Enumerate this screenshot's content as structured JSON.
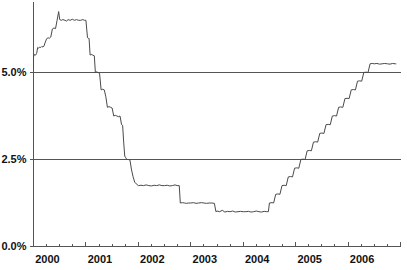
{
  "chart_data": {
    "type": "line",
    "title": "",
    "subtitle": "",
    "xlabel": "",
    "ylabel": "",
    "xlim": [
      2000.0,
      2006.92
    ],
    "ylim": [
      0.0,
      7.0
    ],
    "grid": true,
    "gridlines_y": [
      2.5,
      5.0
    ],
    "legend": null,
    "legend_position": "none",
    "y_tick_labels": [
      "0.0%",
      "2.5%",
      "5.0%"
    ],
    "y_tick_values": [
      0.0,
      2.5,
      5.0
    ],
    "x_tick_labels": [
      "2000",
      "2001",
      "2002",
      "2003",
      "2004",
      "2005",
      "2006"
    ],
    "x_tick_values": [
      2000,
      2001,
      2002,
      2003,
      2004,
      2005,
      2006
    ],
    "x_minor_ticks_per_year": 4,
    "line_color": "#4a4a4a",
    "axis_color": "#555555",
    "background_color": "#ffffff",
    "series": [
      {
        "name": "Rate",
        "x": [
          2000.0,
          2000.02,
          2000.04,
          2000.06,
          2000.08,
          2000.1,
          2000.12,
          2000.14,
          2000.16,
          2000.18,
          2000.2,
          2000.22,
          2000.25,
          2000.28,
          2000.3,
          2000.33,
          2000.36,
          2000.39,
          2000.42,
          2000.45,
          2000.48,
          2000.5,
          2000.53,
          2000.56,
          2000.6,
          2000.63,
          2000.66,
          2000.7,
          2000.74,
          2000.78,
          2000.82,
          2000.86,
          2000.9,
          2000.94,
          2000.97,
          2001.0,
          2001.03,
          2001.05,
          2001.06,
          2001.08,
          2001.1,
          2001.13,
          2001.16,
          2001.18,
          2001.2,
          2001.23,
          2001.26,
          2001.29,
          2001.32,
          2001.35,
          2001.38,
          2001.41,
          2001.44,
          2001.47,
          2001.5,
          2001.53,
          2001.56,
          2001.59,
          2001.62,
          2001.65,
          2001.68,
          2001.7,
          2001.72,
          2001.74,
          2001.76,
          2001.78,
          2001.81,
          2001.84,
          2001.87,
          2001.9,
          2001.93,
          2001.96,
          2002.0,
          2002.05,
          2002.1,
          2002.15,
          2002.2,
          2002.25,
          2002.3,
          2002.35,
          2002.4,
          2002.45,
          2002.5,
          2002.55,
          2002.6,
          2002.65,
          2002.7,
          2002.74,
          2002.78,
          2002.8,
          2002.84,
          2002.88,
          2002.92,
          2002.96,
          2003.0,
          2003.05,
          2003.1,
          2003.15,
          2003.2,
          2003.25,
          2003.3,
          2003.35,
          2003.4,
          2003.45,
          2003.48,
          2003.5,
          2003.55,
          2003.6,
          2003.65,
          2003.7,
          2003.75,
          2003.8,
          2003.85,
          2003.9,
          2003.95,
          2004.0,
          2004.05,
          2004.1,
          2004.15,
          2004.2,
          2004.25,
          2004.3,
          2004.35,
          2004.4,
          2004.45,
          2004.48,
          2004.5,
          2004.55,
          2004.58,
          2004.62,
          2004.66,
          2004.7,
          2004.74,
          2004.78,
          2004.82,
          2004.86,
          2004.9,
          2004.94,
          2004.98,
          2005.02,
          2005.06,
          2005.1,
          2005.14,
          2005.18,
          2005.22,
          2005.26,
          2005.3,
          2005.34,
          2005.38,
          2005.42,
          2005.46,
          2005.5,
          2005.54,
          2005.58,
          2005.62,
          2005.66,
          2005.7,
          2005.74,
          2005.78,
          2005.82,
          2005.86,
          2005.9,
          2005.94,
          2005.98,
          2006.02,
          2006.06,
          2006.1,
          2006.14,
          2006.18,
          2006.22,
          2006.26,
          2006.3,
          2006.34,
          2006.38,
          2006.42,
          2006.46,
          2006.5,
          2006.55,
          2006.6,
          2006.65,
          2006.7,
          2006.75,
          2006.8,
          2006.85,
          2006.9,
          2006.92
        ],
        "y": [
          5.45,
          5.52,
          5.5,
          5.55,
          5.72,
          5.7,
          5.73,
          5.72,
          5.75,
          5.73,
          5.76,
          5.85,
          5.97,
          6.0,
          5.98,
          6.02,
          6.25,
          6.28,
          6.26,
          6.5,
          6.75,
          6.52,
          6.5,
          6.52,
          6.5,
          6.48,
          6.52,
          6.5,
          6.53,
          6.5,
          6.52,
          6.5,
          6.5,
          6.52,
          6.5,
          6.5,
          6.0,
          5.98,
          5.98,
          5.5,
          5.52,
          5.5,
          5.48,
          5.0,
          5.02,
          5.0,
          4.98,
          4.5,
          4.52,
          4.5,
          4.3,
          4.0,
          4.02,
          4.0,
          3.98,
          3.75,
          3.77,
          3.75,
          3.73,
          3.75,
          3.5,
          3.48,
          3.0,
          2.6,
          2.55,
          2.5,
          2.5,
          2.48,
          2.2,
          2.0,
          1.85,
          1.8,
          1.75,
          1.76,
          1.75,
          1.77,
          1.75,
          1.74,
          1.76,
          1.75,
          1.77,
          1.75,
          1.75,
          1.76,
          1.74,
          1.75,
          1.77,
          1.75,
          1.75,
          1.25,
          1.26,
          1.25,
          1.24,
          1.25,
          1.25,
          1.26,
          1.24,
          1.25,
          1.26,
          1.25,
          1.24,
          1.25,
          1.25,
          1.24,
          1.0,
          1.02,
          1.0,
          1.04,
          0.99,
          1.01,
          1.0,
          1.02,
          0.99,
          1.0,
          1.01,
          1.0,
          1.0,
          1.01,
          0.99,
          1.0,
          1.02,
          1.0,
          0.99,
          1.01,
          1.0,
          1.0,
          1.25,
          1.26,
          1.25,
          1.5,
          1.51,
          1.5,
          1.75,
          1.76,
          1.75,
          2.0,
          2.01,
          2.0,
          2.25,
          2.26,
          2.25,
          2.5,
          2.51,
          2.5,
          2.75,
          2.76,
          2.75,
          3.0,
          3.01,
          3.0,
          3.25,
          3.26,
          3.25,
          3.5,
          3.51,
          3.5,
          3.75,
          3.76,
          3.75,
          4.0,
          4.01,
          4.0,
          4.25,
          4.26,
          4.25,
          4.5,
          4.51,
          4.5,
          4.75,
          4.76,
          4.75,
          5.0,
          5.01,
          5.0,
          5.25,
          5.26,
          5.25,
          5.26,
          5.24,
          5.25,
          5.26,
          5.25,
          5.24,
          5.26,
          5.25,
          5.25
        ]
      }
    ]
  }
}
